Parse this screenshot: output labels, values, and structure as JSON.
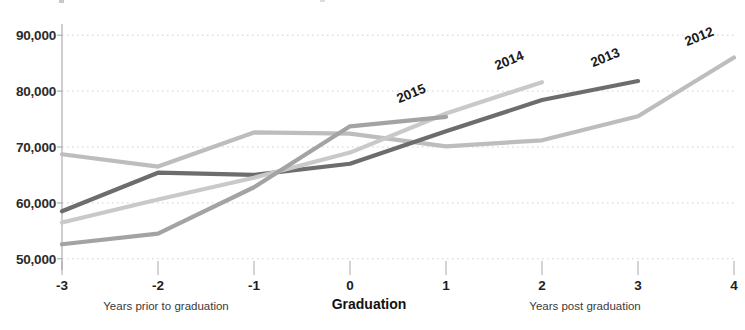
{
  "chart_data": {
    "type": "line",
    "title": "",
    "subtitle": "",
    "xlabel": "Graduation",
    "ylabel": "",
    "xlim": [
      -3,
      4
    ],
    "ylim": [
      48000,
      92000
    ],
    "grid": true,
    "legend_position": "line-end-labels",
    "x": [
      -3,
      -2,
      -1,
      0,
      1,
      2,
      3,
      4
    ],
    "x_tick_labels": [
      "-3",
      "-2",
      "-1",
      "0",
      "1",
      "2",
      "3",
      "4"
    ],
    "y_ticks": [
      50000,
      60000,
      70000,
      80000,
      90000
    ],
    "y_tick_labels": [
      "50,000",
      "60,000",
      "70,000",
      "80,000",
      "90,000"
    ],
    "axis_notes": {
      "left": "Years prior to graduation",
      "center": "Graduation",
      "right": "Years post graduation"
    },
    "series": [
      {
        "name": "2012",
        "color": "#bdbdbd",
        "x": [
          -3,
          -2,
          -1,
          0,
          1,
          2,
          3,
          4
        ],
        "values": [
          68700,
          66500,
          72600,
          72400,
          70100,
          71200,
          75500,
          86000
        ]
      },
      {
        "name": "2013",
        "color": "#6d6d6d",
        "x": [
          -3,
          -2,
          -1,
          0,
          1,
          2,
          3
        ],
        "values": [
          58500,
          65400,
          65000,
          67000,
          72800,
          78400,
          81800
        ]
      },
      {
        "name": "2014",
        "color": "#c9c9c9",
        "x": [
          -3,
          -2,
          -1,
          0,
          1,
          2
        ],
        "values": [
          56500,
          60600,
          64500,
          69000,
          76000,
          81600
        ]
      },
      {
        "name": "2015",
        "color": "#a3a3a3",
        "x": [
          -3,
          -2,
          -1,
          0,
          1
        ],
        "values": [
          52600,
          54500,
          62800,
          73700,
          75400
        ]
      }
    ],
    "series_label_rotation_deg": -22
  },
  "axis": {
    "y_ticks": [
      "50,000",
      "60,000",
      "70,000",
      "80,000",
      "90,000"
    ],
    "x_ticks": [
      "-3",
      "-2",
      "-1",
      "0",
      "1",
      "2",
      "3",
      "4"
    ],
    "note_left": "Years prior to graduation",
    "note_center": "Graduation",
    "note_right": "Years post graduation"
  },
  "series_labels": [
    "2015",
    "2014",
    "2013",
    "2012"
  ]
}
